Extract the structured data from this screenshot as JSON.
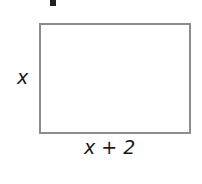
{
  "diagram": {
    "shape": "rectangle",
    "side_label": "x",
    "bottom_label": "x + 2",
    "stroke_color": "#8c8c8c"
  }
}
